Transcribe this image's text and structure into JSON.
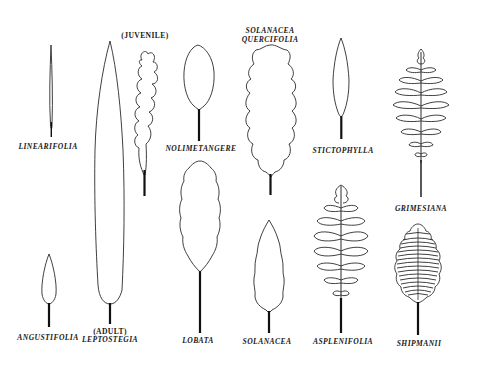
{
  "diagram": {
    "type": "botanical-leaf-forms",
    "background": "#ffffff",
    "ink_color": "#1a1a1a"
  },
  "labels": {
    "linearifolia": "LINEARIFOLIA",
    "angustifolia": "ANGUSTIFOLIA",
    "juvenile": "(JUVENILE)",
    "adult": "(ADULT)",
    "leptostegia": "LEPTOSTEGIA",
    "nolimetangere": "NOLIMETANGERE",
    "lobata": "LOBATA",
    "solanacea_quercifolia_1": "SOLANACEA",
    "solanacea_quercifolia_2": "QUERCIFOLIA",
    "solanacea": "SOLANACEA",
    "stictophylla": "STICTOPHYLLA",
    "asplenifolia": "ASPLENIFOLIA",
    "grimesiana": "GRIMESIANA",
    "shipmanii": "SHIPMANII"
  },
  "leaves": [
    {
      "name": "linearifolia",
      "shape": "very narrow linear blade",
      "column": 1,
      "row": "top"
    },
    {
      "name": "angustifolia",
      "shape": "small lanceolate blade",
      "column": 1,
      "row": "bottom"
    },
    {
      "name": "leptostegia-adult",
      "shape": "long narrow lanceolate blade",
      "column": 2,
      "row": "full"
    },
    {
      "name": "leptostegia-juvenile",
      "shape": "narrow oak-lobed blade",
      "column": 3,
      "row": "top"
    },
    {
      "name": "nolimetangere",
      "shape": "ovate finely-toothed blade",
      "column": 4,
      "row": "top"
    },
    {
      "name": "lobata",
      "shape": "elliptic serrate-lobed blade",
      "column": 4,
      "row": "bottom"
    },
    {
      "name": "solanacea-quercifolia",
      "shape": "broad oak-like lobed blade",
      "column": 5,
      "row": "top"
    },
    {
      "name": "solanacea",
      "shape": "lanceolate deeply serrate blade",
      "column": 5,
      "row": "bottom"
    },
    {
      "name": "stictophylla",
      "shape": "narrow lanceolate wavy blade",
      "column": 6,
      "row": "top"
    },
    {
      "name": "asplenifolia",
      "shape": "pinnate fern-like with ruffled pinnae",
      "column": 6,
      "row": "bottom"
    },
    {
      "name": "grimesiana",
      "shape": "pinnate fern-like with narrow pinnae",
      "column": 7,
      "row": "top"
    },
    {
      "name": "shipmanii",
      "shape": "dense crested pinnate blade",
      "column": 7,
      "row": "bottom"
    }
  ]
}
